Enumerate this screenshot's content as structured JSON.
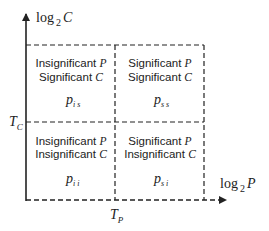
{
  "axes": {
    "y_label": {
      "base": "log",
      "sub": "2",
      "var": "C"
    },
    "x_label": {
      "base": "log",
      "sub": "2",
      "var": "P"
    },
    "y_threshold": {
      "var": "T",
      "sub": "C"
    },
    "x_threshold": {
      "var": "T",
      "sub": "P"
    }
  },
  "quadrants": {
    "top_left": {
      "line1": "Insignificant ",
      "line1_var": "P",
      "line2": "Significant ",
      "line2_var": "C",
      "symbol": "p",
      "symbol_sub": "i s"
    },
    "top_right": {
      "line1": "Significant ",
      "line1_var": "P",
      "line2": "Significant ",
      "line2_var": "C",
      "symbol": "p",
      "symbol_sub": "s s"
    },
    "bottom_left": {
      "line1": "Insignificant ",
      "line1_var": "P",
      "line2": "Insignificant ",
      "line2_var": "C",
      "symbol": "p",
      "symbol_sub": "i i"
    },
    "bottom_right": {
      "line1": "Significant ",
      "line1_var": "P",
      "line2": "Insignificant ",
      "line2_var": "C",
      "symbol": "p",
      "symbol_sub": "s i"
    }
  },
  "colors": {
    "line": "#222222",
    "background": "#ffffff"
  }
}
